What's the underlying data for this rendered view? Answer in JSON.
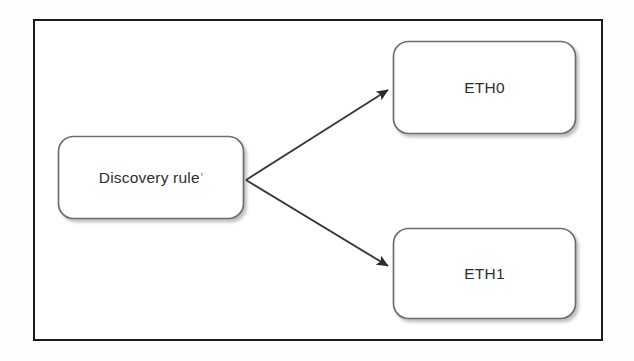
{
  "diagram": {
    "type": "flow-diagram",
    "title": "",
    "frame": {
      "border_color": "#1b1b1b",
      "background_color": "#ffffff"
    },
    "nodes": [
      {
        "id": "discovery-rule",
        "label": "Discovery rule",
        "trailing_mark": "'",
        "shape": "rounded-rectangle",
        "border_color": "#6e6e6e",
        "fill_color": "#ffffff",
        "x": 58,
        "y": 136,
        "width": 186,
        "height": 83
      },
      {
        "id": "eth0",
        "label": "ETH0",
        "trailing_mark": "",
        "shape": "rounded-rectangle",
        "border_color": "#6e6e6e",
        "fill_color": "#ffffff",
        "x": 393,
        "y": 41,
        "width": 183,
        "height": 93
      },
      {
        "id": "eth1",
        "label": "ETH1",
        "trailing_mark": "",
        "shape": "rounded-rectangle",
        "border_color": "#6e6e6e",
        "fill_color": "#ffffff",
        "x": 393,
        "y": 228,
        "width": 183,
        "height": 91
      }
    ],
    "edges": [
      {
        "id": "edge-discovery-to-eth0",
        "from": "discovery-rule",
        "to": "eth0",
        "label": "",
        "style": "solid",
        "arrowhead": "filled-triangle",
        "color": "#3a3a3a"
      },
      {
        "id": "edge-discovery-to-eth1",
        "from": "discovery-rule",
        "to": "eth1",
        "label": "",
        "style": "solid",
        "arrowhead": "filled-triangle",
        "color": "#3a3a3a"
      }
    ]
  }
}
